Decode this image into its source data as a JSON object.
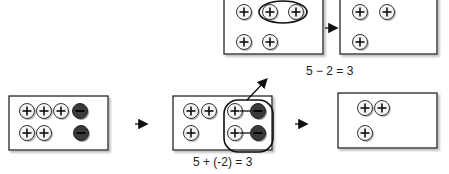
{
  "top": {
    "equation": "5 − 2 = 3",
    "before_counters": [
      "+",
      "+",
      "+",
      "+",
      "+"
    ],
    "after_counters": [
      "+",
      "+",
      "+"
    ]
  },
  "bottom": {
    "equation": "5 + (-2) = 3",
    "start_counters": [
      "+",
      "+",
      "+",
      "−",
      "+",
      "+",
      "−"
    ],
    "zero_pair_counters": [
      "+",
      "+",
      "+",
      "−",
      "+",
      "−"
    ],
    "result_counters": [
      "+",
      "+",
      "+"
    ]
  },
  "symbols": {
    "plus": "+",
    "minus": "−"
  },
  "colors": {
    "positive_fill": "#f2f2f2",
    "negative_fill": "#3a3a3a",
    "border": "#222222"
  }
}
